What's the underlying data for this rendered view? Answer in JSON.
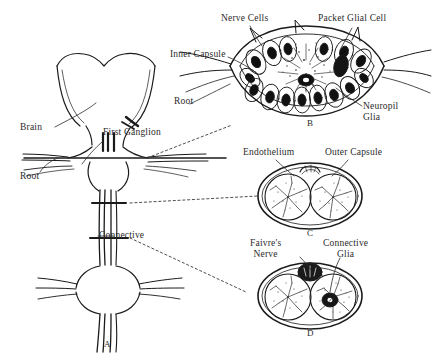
{
  "figure": {
    "background_color": "#ffffff",
    "ink_color": "#1a1a1a"
  },
  "panels": [
    {
      "id": "A",
      "caption": "A",
      "description": "ventral nerve cord with brain, first ganglion, roots and connectives"
    },
    {
      "id": "B",
      "caption": "B",
      "description": "transverse section of a segmental ganglion"
    },
    {
      "id": "C",
      "caption": "C",
      "description": "transverse section of connective showing endothelium and outer capsule"
    },
    {
      "id": "D",
      "caption": "D",
      "description": "transverse section of connective showing Faivre's nerve and connective glia"
    }
  ],
  "labels": {
    "brain": "Brain",
    "first_ganglion": "First Ganglion",
    "root_left": "Root",
    "connective": "Connective",
    "nerve_cells": "Nerve Cells",
    "packet_glial_cell": "Packet Glial Cell",
    "inner_capsule": "Inner Capsule",
    "root_right": "Root",
    "neuropil_glia_line1": "Neuropil",
    "neuropil_glia_line2": "Glia",
    "endothelium": "Endothelium",
    "outer_capsule": "Outer Capsule",
    "faivres_nerve_line1": "Faivre's",
    "faivres_nerve_line2": "Nerve",
    "connective_glia_line1": "Connective",
    "connective_glia_line2": "Glia"
  }
}
